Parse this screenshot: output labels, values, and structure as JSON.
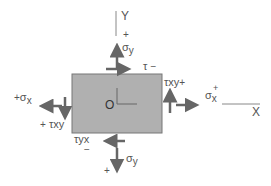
{
  "diagram": {
    "type": "stress-element",
    "colors": {
      "element_fill": "#b0b0b0",
      "element_stroke": "#777777",
      "arrow": "#666666",
      "axis": "#888888",
      "text": "#555555"
    },
    "axes": {
      "y_label": "Y",
      "x_label": "X",
      "origin_label": "O"
    },
    "labels": {
      "sigma_y_top": {
        "symbol": "σ",
        "sub": "y",
        "sign": "+"
      },
      "tau_top": {
        "symbol": "τ",
        "sign": "−"
      },
      "tau_xy_right": {
        "symbol": "τ",
        "sub": "xy",
        "sign": "+"
      },
      "sigma_x_right": {
        "symbol": "σ",
        "sub": "x",
        "sign": "+"
      },
      "sigma_x_left": {
        "symbol": "σ",
        "sub": "x",
        "sign": "+"
      },
      "tau_xy_left": {
        "symbol": "τ",
        "sub": "xy",
        "sign": "+"
      },
      "tau_yx_bottom": {
        "symbol": "τ",
        "sub": "yx",
        "sign": "−"
      },
      "sigma_y_bottom": {
        "symbol": "σ",
        "sub": "y",
        "sign": "+"
      }
    }
  }
}
